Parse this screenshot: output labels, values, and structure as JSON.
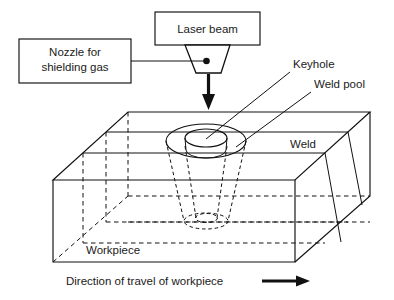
{
  "diagram": {
    "callouts": {
      "laser_beam": "Laser beam",
      "nozzle": "Nozzle for\nshielding gas",
      "nozzle_line1": "Nozzle for",
      "nozzle_line2": "shielding gas",
      "keyhole": "Keyhole",
      "weld_pool": "Weld pool",
      "weld": "Weld",
      "workpiece": "Workpiece",
      "direction": "Direction of travel of workpiece"
    },
    "icons": {
      "beam_arrow": "down-arrow-icon",
      "travel_arrow": "right-arrow-icon",
      "nozzle_shape": "nozzle-icon",
      "gas_connection_dot": "connection-dot-icon"
    },
    "colors": {
      "stroke": "#111111",
      "background": "#ffffff",
      "text": "#1a1a1a"
    }
  }
}
